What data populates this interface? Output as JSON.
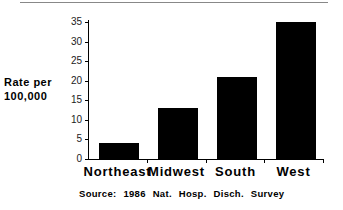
{
  "chart_data": {
    "type": "bar",
    "title": "",
    "xlabel": "",
    "ylabel": "Rate per 100,000",
    "ylabel_lines": [
      "Rate per",
      "100,000"
    ],
    "categories": [
      "Northeast",
      "Midwest",
      "South",
      "West"
    ],
    "values": [
      4,
      13,
      21,
      35
    ],
    "ylim": [
      0,
      35
    ],
    "yticks": [
      0,
      5,
      10,
      15,
      20,
      25,
      30,
      35
    ],
    "grid": false,
    "bar_color": "#000000",
    "annotation": "Source:   1986  Nat.  Hosp.  Disch.  Survey"
  }
}
